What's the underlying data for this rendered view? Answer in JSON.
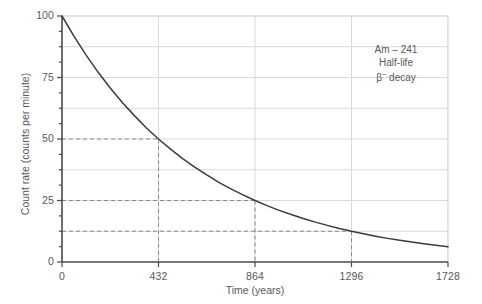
{
  "chart_data": {
    "type": "line",
    "title": "",
    "subtitle": "",
    "xlabel": "Time (years)",
    "ylabel": "Count rate (counts per minute)",
    "xlim": [
      0,
      1728
    ],
    "ylim": [
      0,
      100
    ],
    "xticks": [
      0,
      432,
      864,
      1296,
      1728
    ],
    "xtick_labels": [
      "0",
      "432",
      "864",
      "1296",
      "1728"
    ],
    "yticks": [
      0,
      25,
      50,
      75,
      100
    ],
    "ytick_labels": [
      "0",
      "25",
      "50",
      "75",
      "100"
    ],
    "y_minor_tick_step": 6.25,
    "grid": {
      "horizontal": true,
      "vertical": true,
      "horizontal_step": 12.5,
      "vertical_step": 432,
      "color": "#d9d9d9"
    },
    "legend": null,
    "legend_position": "none",
    "series": [
      {
        "name": "Am-241 activity",
        "color": "#3b3b3b",
        "model": "exponential decay",
        "half_life": 432,
        "initial_value": 100,
        "x": [
          0,
          54,
          108,
          162,
          216,
          270,
          324,
          378,
          432,
          486,
          540,
          594,
          648,
          702,
          756,
          810,
          864,
          918,
          972,
          1026,
          1080,
          1134,
          1188,
          1242,
          1296,
          1350,
          1404,
          1458,
          1512,
          1566,
          1620,
          1674,
          1728
        ],
        "y": [
          100,
          91.7,
          84.1,
          77.1,
          70.7,
          64.8,
          59.5,
          54.5,
          50,
          45.9,
          42.0,
          38.6,
          35.4,
          32.4,
          29.7,
          27.3,
          25,
          22.9,
          21.0,
          19.3,
          17.7,
          16.2,
          14.9,
          13.6,
          12.5,
          11.5,
          10.5,
          9.6,
          8.8,
          8.1,
          7.4,
          6.8,
          6.25
        ]
      }
    ],
    "guide_lines": [
      {
        "label": "first half-life",
        "y": 50,
        "x": 432,
        "style": "dashed",
        "color": "#8a8a8a"
      },
      {
        "label": "second half-life",
        "y": 25,
        "x": 864,
        "style": "dashed",
        "color": "#8a8a8a"
      },
      {
        "label": "third half-life",
        "y": 12.5,
        "x": 1296,
        "style": "dashed",
        "color": "#8a8a8a"
      }
    ],
    "annotations": [
      {
        "name": "isotope-annotation",
        "lines": [
          "Am – 241",
          "Half-life",
          "β⁻ decay"
        ],
        "x": 1550,
        "y": 72
      }
    ]
  },
  "annotation": {
    "line1": "Am – 241",
    "line2": "Half-life",
    "beta": "β",
    "beta_sup": "−",
    "decay": " decay"
  },
  "axes": {
    "x_title": "Time (years)",
    "y_title": "Count rate (counts per minute)"
  },
  "colors": {
    "curve": "#3b3b3b",
    "grid": "#d9d9d9",
    "axis": "#4a4a4a",
    "guide": "#8a8a8a",
    "text": "#58585a",
    "background": "#ffffff"
  }
}
